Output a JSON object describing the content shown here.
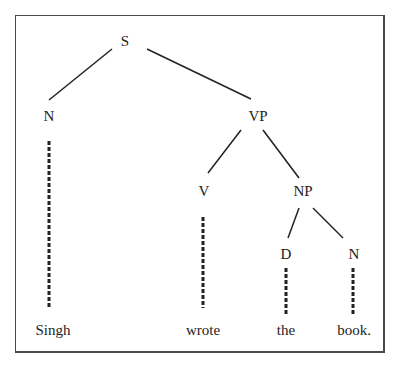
{
  "diagram": {
    "type": "syntax-tree",
    "nodes": {
      "s": "S",
      "n_subject": "N",
      "vp": "VP",
      "v": "V",
      "np": "NP",
      "d": "D",
      "n_object": "N"
    },
    "leaves": {
      "singh": "Singh",
      "wrote": "wrote",
      "the": "the",
      "book": "book."
    },
    "edges": [
      [
        "S",
        "N"
      ],
      [
        "S",
        "VP"
      ],
      [
        "VP",
        "V"
      ],
      [
        "VP",
        "NP"
      ],
      [
        "NP",
        "D"
      ],
      [
        "NP",
        "N"
      ]
    ],
    "leaf_links": [
      [
        "N",
        "Singh"
      ],
      [
        "V",
        "wrote"
      ],
      [
        "D",
        "the"
      ],
      [
        "N",
        "book."
      ]
    ],
    "colors": {
      "line": "#222222",
      "frame": "#4a4a4a",
      "background": "#ffffff"
    }
  }
}
